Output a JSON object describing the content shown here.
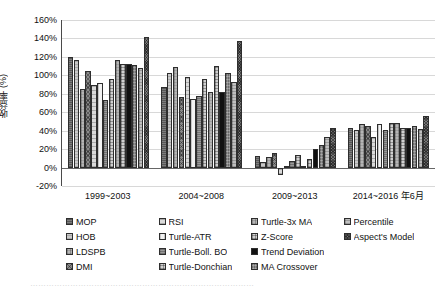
{
  "chart_data": {
    "type": "bar",
    "title": "",
    "xlabel": "",
    "ylabel": "收益率 (%)",
    "ylim": [
      -20,
      160
    ],
    "ytick_step": 20,
    "ytick_labels": [
      "160%",
      "140%",
      "120%",
      "100%",
      "80%",
      "60%",
      "40%",
      "20%",
      "0%",
      "-20%"
    ],
    "ytick_values": [
      160,
      140,
      120,
      100,
      80,
      60,
      40,
      20,
      0,
      -20
    ],
    "grid": true,
    "legend_position": "bottom",
    "categories": [
      "1999~2003",
      "2004~2008",
      "2009~2013",
      "2014~2016 年6月"
    ],
    "series": [
      {
        "name": "MOP",
        "pattern": "p0",
        "values": [
          120,
          87,
          12,
          43
        ]
      },
      {
        "name": "HOB",
        "pattern": "p1",
        "values": [
          117,
          103,
          6,
          41
        ]
      },
      {
        "name": "LDSPB",
        "pattern": "p2",
        "values": [
          85,
          109,
          11,
          47
        ]
      },
      {
        "name": "DMI",
        "pattern": "p3",
        "values": [
          105,
          76,
          16,
          45
        ]
      },
      {
        "name": "RSI",
        "pattern": "p4",
        "values": [
          90,
          98,
          -8,
          33
        ]
      },
      {
        "name": "Turtle-ATR",
        "pattern": "p5",
        "values": [
          92,
          74,
          2,
          47
        ]
      },
      {
        "name": "Turtle-Boll. BO",
        "pattern": "p6",
        "values": [
          73,
          78,
          7,
          41
        ]
      },
      {
        "name": "Turtle-Donchian",
        "pattern": "p7",
        "values": [
          96,
          96,
          14,
          48
        ]
      },
      {
        "name": "Turtle-3x MA",
        "pattern": "p2",
        "values": [
          117,
          82,
          2,
          48
        ]
      },
      {
        "name": "Z-Score",
        "pattern": "p7",
        "values": [
          112,
          110,
          9,
          43
        ]
      },
      {
        "name": "Trend Deviation",
        "pattern": "p8",
        "values": [
          112,
          82,
          20,
          43
        ]
      },
      {
        "name": "MA Crossover",
        "pattern": "p9",
        "values": [
          111,
          102,
          25,
          45
        ]
      },
      {
        "name": "Percentile",
        "pattern": "p10",
        "values": [
          108,
          93,
          33,
          42
        ]
      },
      {
        "name": "Aspect's Model",
        "pattern": "p11",
        "values": [
          142,
          137,
          43,
          56
        ]
      }
    ]
  },
  "axis": {
    "y_title": "收益率 (%)",
    "y_ticks": [
      "160%",
      "140%",
      "120%",
      "100%",
      "80%",
      "60%",
      "40%",
      "20%",
      "0%",
      "-20%"
    ],
    "x_group_labels": [
      "1999~2003",
      "2004~2008",
      "2009~2013",
      "2014~2016 年6月"
    ]
  },
  "legend": {
    "items": [
      {
        "label": "MOP",
        "pattern": "p0"
      },
      {
        "label": "HOB",
        "pattern": "p1"
      },
      {
        "label": "LDSPB",
        "pattern": "p2"
      },
      {
        "label": "DMI",
        "pattern": "p3"
      },
      {
        "label": "RSI",
        "pattern": "p4"
      },
      {
        "label": "Turtle-ATR",
        "pattern": "p5"
      },
      {
        "label": "Turtle-Boll. BO",
        "pattern": "p6"
      },
      {
        "label": "Turtle-Donchian",
        "pattern": "p7"
      },
      {
        "label": "Turtle-3x MA",
        "pattern": "p2"
      },
      {
        "label": "Z-Score",
        "pattern": "p7"
      },
      {
        "label": "Trend Deviation",
        "pattern": "p8"
      },
      {
        "label": "MA Crossover",
        "pattern": "p9"
      },
      {
        "label": "Percentile",
        "pattern": "p10"
      },
      {
        "label": "Aspect's Model",
        "pattern": "p11"
      }
    ]
  },
  "caption": {
    "text": "…………………………………………………………………………"
  },
  "colors": {
    "axis": "#4a4a4a",
    "grid": "#d8d8d8",
    "text": "#111111",
    "bar_outline": "#2e2e2e",
    "highlight_black": "#111111"
  }
}
